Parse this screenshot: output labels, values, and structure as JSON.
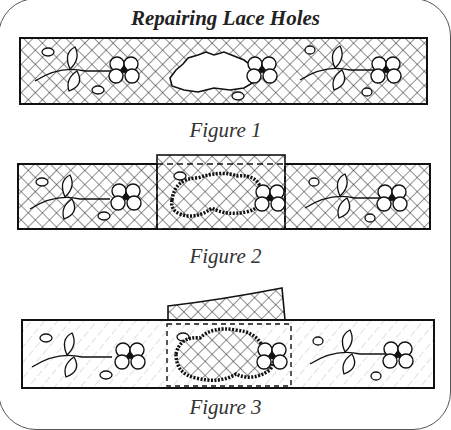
{
  "title": "Repairing Lace Holes",
  "figures": [
    {
      "id": 1,
      "caption": "Figure 1",
      "description": "Lace strip with floral motifs and an irregular hole in the center"
    },
    {
      "id": 2,
      "caption": "Figure 2",
      "description": "New lace patch placed over the hole; hole edge whipstitched; dashed outline marks patch area"
    },
    {
      "id": 3,
      "caption": "Figure 3",
      "description": "Patch trimmed around stitched edge; excess patch lace folded back above strip"
    }
  ],
  "colors": {
    "ink": "#1a1a1a",
    "background": "#ffffff",
    "frame": "#555555"
  }
}
